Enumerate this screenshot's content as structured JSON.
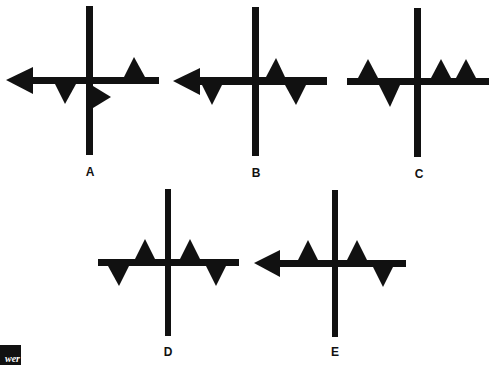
{
  "figures": [
    {
      "id": "A",
      "label": "A",
      "vertical_bar": {
        "x": 86,
        "y": 6,
        "w": 7,
        "h": 149
      },
      "horizontal_bar": {
        "x": 32,
        "y": 77,
        "w": 127,
        "h": 7
      },
      "label_pos": {
        "x": 90,
        "y": 176
      },
      "shapes": [
        {
          "kind": "arrowhead-left",
          "points": "6,80 33,67 33,94"
        },
        {
          "kind": "triangle-down",
          "points": "55,84 76,84 65,104"
        },
        {
          "kind": "triangle-right",
          "points": "93,86 93,108 111,97"
        },
        {
          "kind": "triangle-up",
          "points": "124,77 145,77 134,57"
        }
      ]
    },
    {
      "id": "B",
      "label": "B",
      "vertical_bar": {
        "x": 252,
        "y": 7,
        "w": 7,
        "h": 149
      },
      "horizontal_bar": {
        "x": 199,
        "y": 77,
        "w": 128,
        "h": 8
      },
      "label_pos": {
        "x": 256,
        "y": 177
      },
      "shapes": [
        {
          "kind": "arrowhead-left",
          "points": "173,81 200,68 200,95"
        },
        {
          "kind": "triangle-down",
          "points": "202,85 222,85 212,105"
        },
        {
          "kind": "triangle-up",
          "points": "266,77 285,77 276,58"
        },
        {
          "kind": "triangle-down",
          "points": "285,85 306,85 296,105"
        }
      ]
    },
    {
      "id": "C",
      "label": "C",
      "vertical_bar": {
        "x": 414,
        "y": 8,
        "w": 7,
        "h": 149
      },
      "horizontal_bar": {
        "x": 347,
        "y": 78,
        "w": 142,
        "h": 7
      },
      "label_pos": {
        "x": 419,
        "y": 178
      },
      "shapes": [
        {
          "kind": "triangle-up",
          "points": "358,78 378,78 368,59"
        },
        {
          "kind": "triangle-down",
          "points": "379,85 400,85 390,107"
        },
        {
          "kind": "triangle-up",
          "points": "431,78 451,78 441,59"
        },
        {
          "kind": "triangle-up",
          "points": "456,78 476,78 466,59"
        }
      ]
    },
    {
      "id": "D",
      "label": "D",
      "vertical_bar": {
        "x": 165,
        "y": 189,
        "w": 6,
        "h": 147
      },
      "horizontal_bar": {
        "x": 98,
        "y": 259,
        "w": 141,
        "h": 7
      },
      "label_pos": {
        "x": 168,
        "y": 356
      },
      "shapes": [
        {
          "kind": "triangle-down",
          "points": "108,266 129,266 119,286"
        },
        {
          "kind": "triangle-up",
          "points": "135,259 155,259 145,239"
        },
        {
          "kind": "triangle-up",
          "points": "180,259 200,259 190,239"
        },
        {
          "kind": "triangle-down",
          "points": "206,266 226,266 216,286"
        }
      ]
    },
    {
      "id": "E",
      "label": "E",
      "vertical_bar": {
        "x": 332,
        "y": 190,
        "w": 6,
        "h": 147
      },
      "horizontal_bar": {
        "x": 278,
        "y": 260,
        "w": 128,
        "h": 7
      },
      "label_pos": {
        "x": 335,
        "y": 356
      },
      "shapes": [
        {
          "kind": "arrowhead-left",
          "points": "254,263 280,250 280,277"
        },
        {
          "kind": "triangle-up",
          "points": "298,260 318,260 308,240"
        },
        {
          "kind": "triangle-up",
          "points": "347,260 367,260 357,240"
        },
        {
          "kind": "triangle-down",
          "points": "373,267 393,267 383,287"
        }
      ]
    }
  ],
  "corner_tag": {
    "text": "wer"
  },
  "colors": {
    "ink": "#111111",
    "background": "#ffffff"
  }
}
